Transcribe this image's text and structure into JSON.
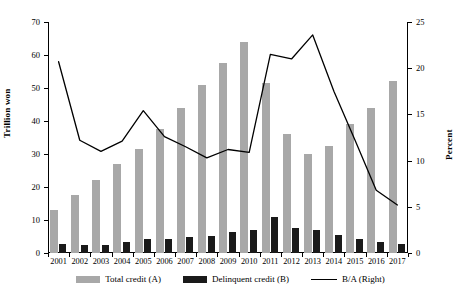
{
  "chart_data": {
    "type": "bar",
    "title": "",
    "xlabel": "",
    "ylabel": "Trillion won",
    "y2label": "Percent",
    "categories": [
      "2001",
      "2002",
      "2003",
      "2004",
      "2005",
      "2006",
      "2007",
      "2008",
      "2009",
      "2010",
      "2011",
      "2012",
      "2013",
      "2014",
      "2015",
      "2016",
      "2017"
    ],
    "ylim": [
      0,
      70
    ],
    "y2lim": [
      0,
      25
    ],
    "yticks": [
      0,
      10,
      20,
      30,
      40,
      50,
      60,
      70
    ],
    "y2ticks": [
      0,
      5,
      10,
      15,
      20,
      25
    ],
    "grid": false,
    "legend_position": "bottom",
    "series": [
      {
        "name": "Total credit (A)",
        "type": "bar",
        "axis": "left",
        "color": "#a8a8a8",
        "values": [
          13.0,
          17.5,
          22.0,
          27.0,
          31.5,
          37.5,
          44.0,
          51.0,
          57.5,
          64.0,
          51.5,
          36.0,
          30.0,
          32.5,
          39.0,
          44.0,
          52.0
        ]
      },
      {
        "name": "Delinquent credit (B)",
        "type": "bar",
        "axis": "left",
        "color": "#1a1a1a",
        "values": [
          2.8,
          2.3,
          2.3,
          3.2,
          4.3,
          4.3,
          5.0,
          5.3,
          6.5,
          7.0,
          11.0,
          7.5,
          7.0,
          5.5,
          4.2,
          3.2,
          2.7
        ]
      },
      {
        "name": "B/A (Right)",
        "type": "line",
        "axis": "right",
        "color": "#000000",
        "values": [
          20.7,
          12.2,
          11.0,
          12.1,
          15.4,
          12.6,
          11.5,
          10.3,
          11.2,
          10.9,
          21.5,
          21.0,
          23.6,
          17.5,
          12.2,
          6.8,
          5.2
        ]
      }
    ]
  },
  "axes": {
    "left_title": "Trillion won",
    "right_title": "Percent"
  },
  "legend": {
    "items": [
      {
        "label": "Total credit (A)",
        "swatch": "bar-gray"
      },
      {
        "label": "Delinquent credit (B)",
        "swatch": "bar-black"
      },
      {
        "label": "B/A (Right)",
        "swatch": "line-black"
      }
    ]
  },
  "colors": {
    "total_credit": "#a8a8a8",
    "delinquent_credit": "#1a1a1a",
    "ratio_line": "#000000",
    "axis": "#000000",
    "background": "#ffffff"
  }
}
